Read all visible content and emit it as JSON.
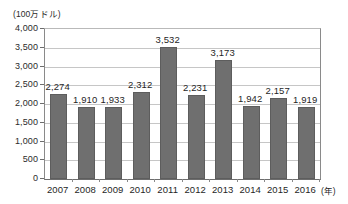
{
  "chart_data": {
    "type": "bar",
    "title": "",
    "subtitle": "",
    "unit_label": "(100万ドル)",
    "xlabel": "(年)",
    "ylabel": "",
    "categories": [
      "2007",
      "2008",
      "2009",
      "2010",
      "2011",
      "2012",
      "2013",
      "2014",
      "2015",
      "2016"
    ],
    "values": [
      2274,
      1910,
      1933,
      2312,
      3532,
      2231,
      3173,
      1942,
      2157,
      1919
    ],
    "value_labels": [
      "2,274",
      "1,910",
      "1,933",
      "2,312",
      "3,532",
      "2,231",
      "3,173",
      "1,942",
      "2,157",
      "1,919"
    ],
    "ylim": [
      0,
      4000
    ],
    "ytick_values": [
      4000,
      3500,
      3000,
      2500,
      2000,
      1500,
      1000,
      500,
      0
    ],
    "ytick_labels": [
      "4,000",
      "3,500",
      "3,000",
      "2,500",
      "2,000",
      "1,500",
      "1,000",
      "500",
      "0"
    ],
    "grid": true,
    "legend": null,
    "legend_position": "none",
    "series": [
      {
        "name": "",
        "values": [
          2274,
          1910,
          1933,
          2312,
          3532,
          2231,
          3173,
          1942,
          2157,
          1919
        ],
        "color": "#6f6f6f"
      }
    ],
    "colors": {
      "bar_fill": "#6f6f6f",
      "bar_stroke": "#5d5d5d",
      "gridline": "#c6c6c6",
      "axis": "#6d6d6d",
      "text": "#1f1f1f",
      "background": "#ffffff"
    }
  }
}
